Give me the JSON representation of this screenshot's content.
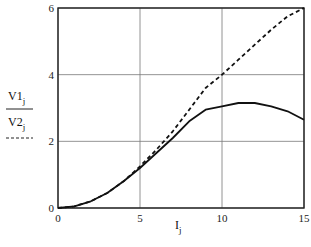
{
  "chart_data": {
    "type": "line",
    "title": "",
    "xlabel": "I_j",
    "ylabel": "V1_j (solid), V2_j (dashed)",
    "xlim": [
      0,
      15
    ],
    "ylim": [
      0,
      6
    ],
    "xticks": [
      "0",
      "5",
      "10",
      "15"
    ],
    "yticks": [
      "0",
      "2",
      "4",
      "6"
    ],
    "grid": true,
    "legend_position": "left of y-axis",
    "x": [
      0,
      1,
      2,
      3,
      4,
      5,
      6,
      7,
      8,
      9,
      10,
      11,
      12,
      13,
      14,
      15
    ],
    "series": [
      {
        "name": "V1_j",
        "style": "solid",
        "values": [
          0,
          0.05,
          0.2,
          0.45,
          0.8,
          1.2,
          1.65,
          2.1,
          2.6,
          2.95,
          3.05,
          3.15,
          3.15,
          3.05,
          2.9,
          2.65
        ]
      },
      {
        "name": "V2_j",
        "style": "dashed",
        "values": [
          0,
          0.05,
          0.2,
          0.45,
          0.8,
          1.25,
          1.75,
          2.3,
          2.95,
          3.6,
          4.0,
          4.45,
          4.9,
          5.35,
          5.75,
          6.0
        ]
      }
    ]
  },
  "labels": {
    "y_top_main": "V1",
    "y_top_sub": "j",
    "y_bottom_main": "V2",
    "y_bottom_sub": "j",
    "x_main": "I",
    "x_sub": "j"
  }
}
